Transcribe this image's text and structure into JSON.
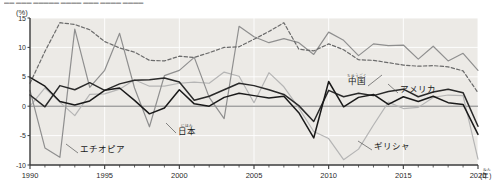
{
  "title_strip": {
    "text": "▬▬ ▬▬▬ ▬▬▬▬▬ ▬▬▬▬ ▬▬▬ ▬▬▬▬  ▬▬▬▬"
  },
  "axis": {
    "unit_label": "(%)",
    "y_ticks": [
      "15",
      "10",
      "5",
      "0",
      "-5",
      "-10"
    ],
    "y_values": [
      15,
      10,
      5,
      0,
      -5,
      -10
    ],
    "x_ticks": [
      "1990",
      "1995",
      "2000",
      "2005",
      "2010",
      "2015",
      "2020"
    ],
    "x_values": [
      1990,
      1995,
      2000,
      2005,
      2010,
      2015,
      2020
    ],
    "x_unit": "(年)",
    "x_unit_ruby": "ねん"
  },
  "annotations": [
    {
      "id": "china",
      "label": "中国",
      "ruby": "ちゅうごく",
      "x": 348,
      "y": 84,
      "ruby_y": 77,
      "leader": "M 368 81 L 382 70"
    },
    {
      "id": "america",
      "label": "アメリカ",
      "ruby": "",
      "x": 400,
      "y": 92,
      "ruby_y": 0,
      "leader": "M 398 88 L 388 79"
    },
    {
      "id": "japan",
      "label": "日本",
      "ruby": "にほん",
      "x": 178,
      "y": 134,
      "ruby_y": 127,
      "leader": "M 176 128 L 166 118"
    },
    {
      "id": "ethiopia",
      "label": "エチオピア",
      "ruby": "",
      "x": 80,
      "y": 152,
      "ruby_y": 0,
      "leader": "M 78 148 L 66 139"
    },
    {
      "id": "greece",
      "label": "ギリシャ",
      "ruby": "",
      "x": 374,
      "y": 149,
      "ruby_y": 0,
      "leader": "M 372 145 L 358 136"
    }
  ],
  "colors": {
    "china": "#6b6b6b",
    "america": "#2a2a2a",
    "japan": "#1a1a1a",
    "ethiopia": "#8f8f8f",
    "greece": "#b5b5b5",
    "plot_bg": "#eceae6",
    "grid": "#ffffff",
    "axis": "#3a3a3a",
    "zero_line": "#6e6e6e",
    "page_bg": "#ffffff"
  },
  "chart_data": {
    "type": "line",
    "title": "",
    "subtitle": "",
    "xlabel": "(年)",
    "ylabel": "(%)",
    "xlim": [
      1990,
      2020
    ],
    "ylim": [
      -10,
      15
    ],
    "grid": true,
    "legend": "inline-annotations",
    "x": [
      1990,
      1991,
      1992,
      1993,
      1994,
      1995,
      1996,
      1997,
      1998,
      1999,
      2000,
      2001,
      2002,
      2003,
      2004,
      2005,
      2006,
      2007,
      2008,
      2009,
      2010,
      2011,
      2012,
      2013,
      2014,
      2015,
      2016,
      2017,
      2018,
      2019,
      2020
    ],
    "series": [
      {
        "name": "中国",
        "name_en": "China",
        "style": "dashed",
        "color": "#6b6b6b",
        "values": [
          3.9,
          9.3,
          14.2,
          13.9,
          13.0,
          11.0,
          9.9,
          9.2,
          7.8,
          7.7,
          8.5,
          8.3,
          9.1,
          10.0,
          10.1,
          11.4,
          12.7,
          14.2,
          9.7,
          9.4,
          10.6,
          9.6,
          7.9,
          7.8,
          7.4,
          7.0,
          6.8,
          6.9,
          6.7,
          6.0,
          2.3
        ]
      },
      {
        "name": "アメリカ",
        "name_en": "United States",
        "style": "solid",
        "color": "#2a2a2a",
        "values": [
          1.9,
          -0.1,
          3.5,
          2.8,
          4.0,
          2.7,
          3.8,
          4.4,
          4.5,
          4.8,
          4.1,
          1.0,
          1.7,
          2.8,
          3.9,
          3.5,
          2.8,
          2.0,
          0.1,
          -2.6,
          2.7,
          1.6,
          2.2,
          1.8,
          2.5,
          2.9,
          1.6,
          2.4,
          2.9,
          2.3,
          -3.4
        ]
      },
      {
        "name": "日本",
        "name_en": "Japan",
        "style": "solid",
        "color": "#1a1a1a",
        "values": [
          4.9,
          3.4,
          0.8,
          0.2,
          0.9,
          2.7,
          3.1,
          1.0,
          -1.3,
          -0.3,
          2.8,
          0.4,
          0.0,
          1.5,
          2.2,
          1.8,
          1.4,
          1.7,
          -1.1,
          -5.4,
          4.2,
          -0.1,
          1.5,
          2.0,
          0.3,
          1.6,
          0.8,
          1.7,
          0.6,
          0.3,
          -4.8
        ]
      },
      {
        "name": "エチオピア",
        "name_en": "Ethiopia",
        "style": "solid",
        "color": "#8f8f8f",
        "values": [
          2.7,
          -7.1,
          -8.7,
          13.1,
          3.2,
          6.1,
          12.4,
          3.1,
          -3.5,
          5.2,
          6.1,
          8.3,
          1.5,
          -2.1,
          13.6,
          11.8,
          10.8,
          11.5,
          10.8,
          8.8,
          12.6,
          11.2,
          8.6,
          10.6,
          10.3,
          10.4,
          8.0,
          10.2,
          7.7,
          9.0,
          6.1
        ]
      },
      {
        "name": "ギリシャ",
        "name_en": "Greece",
        "style": "solid",
        "color": "#b5b5b5",
        "values": [
          0.0,
          3.1,
          0.7,
          -1.6,
          2.0,
          2.1,
          2.9,
          4.5,
          3.4,
          3.4,
          3.9,
          4.1,
          3.9,
          5.8,
          5.1,
          0.6,
          5.7,
          3.3,
          -0.3,
          -4.3,
          -5.5,
          -9.1,
          -7.3,
          -3.2,
          0.7,
          -0.4,
          -0.2,
          1.5,
          1.9,
          1.8,
          -9.0
        ]
      }
    ]
  }
}
